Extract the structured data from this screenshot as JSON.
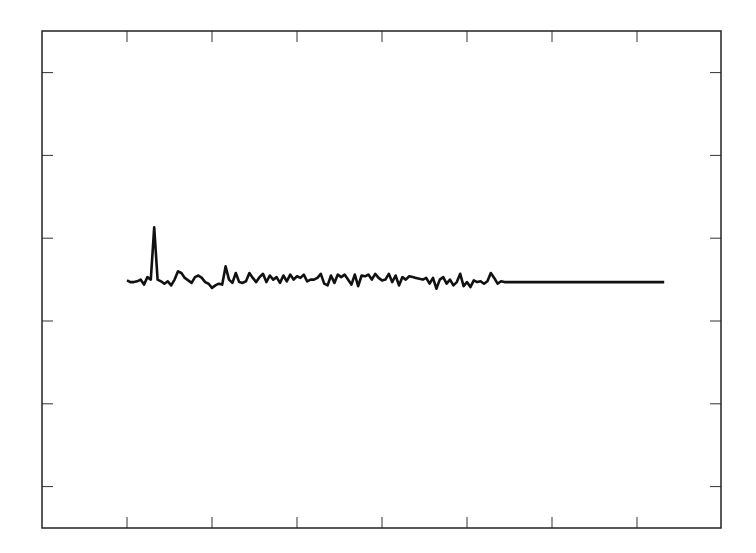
{
  "chart_data": {
    "type": "line",
    "title": "",
    "xlabel": "",
    "ylabel": "",
    "xlim": [
      -1,
      7
    ],
    "ylim": [
      -2.5,
      3.5
    ],
    "grid": false,
    "legend": null,
    "x_ticks": [
      0,
      1,
      2,
      3,
      4,
      5,
      6
    ],
    "y_ticks": [
      -2,
      -1,
      0,
      1,
      2,
      3
    ],
    "tick_labels_visible": false,
    "series": [
      {
        "name": "signal",
        "color": "#111111",
        "x_start": 0.0,
        "x_step": 0.04,
        "values": [
          0.49,
          0.47,
          0.47,
          0.48,
          0.5,
          0.44,
          0.53,
          0.5,
          1.13,
          0.5,
          0.48,
          0.45,
          0.48,
          0.43,
          0.5,
          0.6,
          0.58,
          0.52,
          0.49,
          0.46,
          0.53,
          0.55,
          0.52,
          0.47,
          0.45,
          0.4,
          0.43,
          0.45,
          0.44,
          0.66,
          0.5,
          0.46,
          0.58,
          0.47,
          0.46,
          0.48,
          0.58,
          0.52,
          0.47,
          0.53,
          0.57,
          0.47,
          0.55,
          0.5,
          0.53,
          0.46,
          0.55,
          0.48,
          0.56,
          0.5,
          0.54,
          0.52,
          0.56,
          0.48,
          0.5,
          0.5,
          0.52,
          0.57,
          0.45,
          0.43,
          0.55,
          0.46,
          0.56,
          0.53,
          0.56,
          0.5,
          0.44,
          0.56,
          0.42,
          0.55,
          0.54,
          0.56,
          0.5,
          0.57,
          0.52,
          0.49,
          0.5,
          0.57,
          0.47,
          0.55,
          0.43,
          0.53,
          0.5,
          0.54,
          0.53,
          0.52,
          0.51,
          0.5,
          0.52,
          0.45,
          0.52,
          0.39,
          0.5,
          0.53,
          0.45,
          0.5,
          0.43,
          0.47,
          0.57,
          0.42,
          0.47,
          0.41,
          0.49,
          0.47,
          0.48,
          0.45,
          0.48,
          0.58,
          0.52,
          0.45,
          0.48,
          0.47,
          0.47,
          0.47,
          0.47,
          0.47,
          0.47,
          0.47,
          0.47,
          0.47,
          0.47,
          0.47,
          0.47,
          0.47,
          0.47,
          0.47,
          0.47,
          0.47,
          0.47,
          0.47,
          0.47,
          0.47,
          0.47,
          0.47,
          0.47,
          0.47,
          0.47,
          0.47,
          0.47,
          0.47,
          0.47,
          0.47,
          0.47,
          0.47,
          0.47,
          0.47,
          0.47,
          0.47,
          0.47,
          0.47,
          0.47,
          0.47,
          0.47,
          0.47,
          0.47,
          0.47,
          0.47,
          0.47,
          0.47,
          0.47
        ]
      }
    ]
  }
}
